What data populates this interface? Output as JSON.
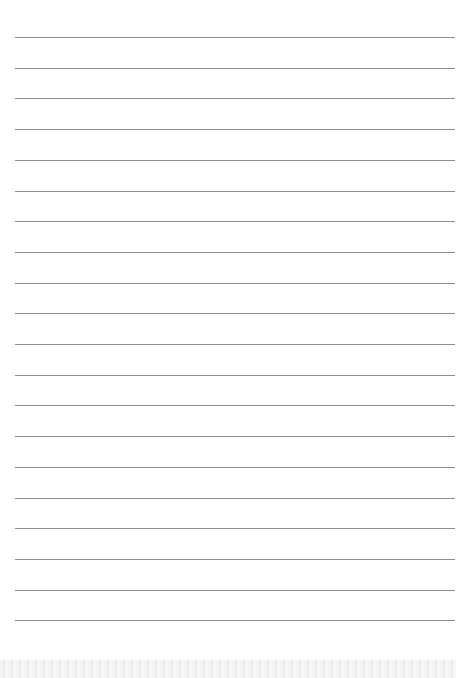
{
  "page": {
    "type": "lined-paper",
    "line_count": 20,
    "first_line_y": 37,
    "line_spacing": 30.7,
    "line_color": "#8e8e8e",
    "background_color": "#ffffff",
    "bottom_strip_color": "#eeeeee"
  }
}
